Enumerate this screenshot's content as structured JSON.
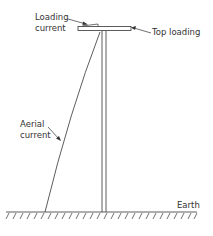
{
  "labels": {
    "loading_current_1": "Loading",
    "loading_current_2": "current",
    "top_loading": "Top loading",
    "aerial_current_1": "Aerial",
    "aerial_current_2": "current",
    "earth": "Earth"
  },
  "colors": {
    "line": "#333333",
    "background": "#ffffff"
  }
}
